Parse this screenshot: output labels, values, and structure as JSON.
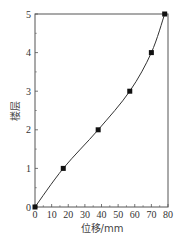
{
  "chart_data": {
    "type": "line",
    "title": "",
    "xlabel": "位移/mm",
    "ylabel": "楼层",
    "xlim": [
      0,
      80
    ],
    "ylim": [
      0,
      5
    ],
    "x_ticks": [
      0,
      10,
      20,
      30,
      40,
      50,
      60,
      70,
      80
    ],
    "y_ticks": [
      0,
      1,
      2,
      3,
      4,
      5
    ],
    "grid": false,
    "legend": null,
    "series": [
      {
        "name": "楼层位移",
        "marker": "square",
        "color": "#222222",
        "x": [
          0,
          17,
          38,
          57,
          70,
          78
        ],
        "y": [
          0,
          1,
          2,
          3,
          4,
          5
        ]
      }
    ]
  },
  "labels": {
    "xlabel": "位移/mm",
    "ylabel": "楼层"
  },
  "colors": {
    "axis": "#555555",
    "line": "#333333",
    "marker": "#111111"
  }
}
